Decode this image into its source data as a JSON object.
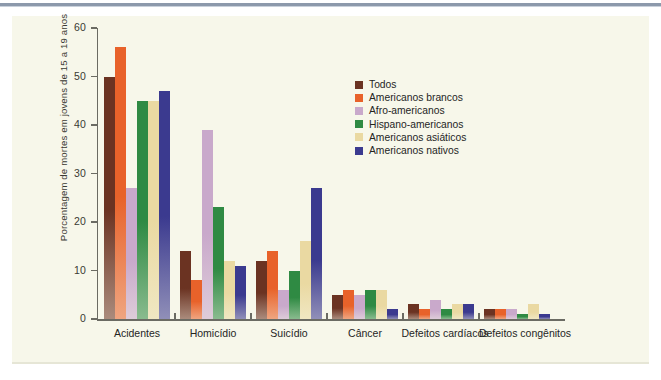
{
  "figure": {
    "background_color": "#f7f7ea",
    "page_background": "#ffffff",
    "rule_color": "#8c99ab"
  },
  "chart_data": {
    "type": "bar",
    "title": "",
    "subtitle": "",
    "xlabel": "",
    "ylabel": "Porcentagem de mortes em jovens de 15 a 19 anos",
    "ylim": [
      0,
      60
    ],
    "yticks": [
      0,
      10,
      20,
      30,
      40,
      50,
      60
    ],
    "ytick_labels": [
      "0",
      "10",
      "20",
      "30",
      "40",
      "50",
      "60"
    ],
    "grid": false,
    "legend_position": "upper right inside",
    "categories": [
      "Acidentes",
      "Homicídio",
      "Suicídio",
      "Câncer",
      "Defeitos cardíacos",
      "Defeitos congênitos"
    ],
    "series": [
      {
        "name": "Todos",
        "color": "#6b3322",
        "values": [
          50,
          14,
          12,
          5,
          3,
          2
        ]
      },
      {
        "name": "Americanos brancos",
        "color": "#e8622a",
        "values": [
          56,
          8,
          14,
          6,
          2,
          2
        ]
      },
      {
        "name": "Afro-americanos",
        "color": "#c9a9cb",
        "values": [
          27,
          39,
          6,
          5,
          4,
          2
        ]
      },
      {
        "name": "Hispano-americanos",
        "color": "#2f8a43",
        "values": [
          45,
          23,
          10,
          6,
          2,
          1
        ]
      },
      {
        "name": "Americanos asiáticos",
        "color": "#ead9a2",
        "values": [
          45,
          12,
          16,
          6,
          3,
          3
        ]
      },
      {
        "name": "Americanos nativos",
        "color": "#3b3a8f",
        "values": [
          47,
          11,
          27,
          2,
          3,
          1
        ]
      }
    ]
  },
  "legend": {
    "items": [
      {
        "label": "Todos",
        "swatch": "#6b3322"
      },
      {
        "label": "Americanos brancos",
        "swatch": "#e8622a"
      },
      {
        "label": "Afro-americanos",
        "swatch": "#c9a9cb"
      },
      {
        "label": "Hispano-americanos",
        "swatch": "#2f8a43"
      },
      {
        "label": "Americanos asiáticos",
        "swatch": "#ead9a2"
      },
      {
        "label": "Americanos nativos",
        "swatch": "#3b3a8f"
      }
    ]
  }
}
